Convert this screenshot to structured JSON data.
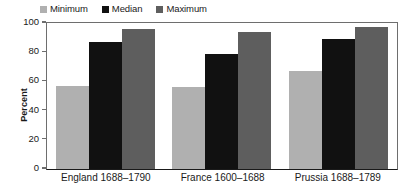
{
  "chart_data": {
    "type": "bar",
    "title": "",
    "subtitle": "",
    "xlabel": "",
    "ylabel": "Percent",
    "ylim": [
      0,
      100
    ],
    "yticks": [
      "0",
      "20",
      "40",
      "60",
      "80",
      "100"
    ],
    "grid": false,
    "legend_position": "top-left",
    "categories": [
      "England 1688–1790",
      "France 1600–1688",
      "Prussia 1688–1789"
    ],
    "series": [
      {
        "name": "Minimum",
        "color": "#b0b0b0",
        "values": [
          57,
          56,
          67
        ]
      },
      {
        "name": "Median",
        "color": "#111111",
        "values": [
          87,
          79,
          89
        ]
      },
      {
        "name": "Maximum",
        "color": "#5e5e5e",
        "values": [
          96,
          94,
          97
        ]
      }
    ]
  },
  "axis": {
    "ticks": [
      {
        "label": "100",
        "value": 100
      },
      {
        "label": "80",
        "value": 80
      },
      {
        "label": "60",
        "value": 60
      },
      {
        "label": "40",
        "value": 40
      },
      {
        "label": "20",
        "value": 20
      },
      {
        "label": "0",
        "value": 0
      }
    ]
  }
}
